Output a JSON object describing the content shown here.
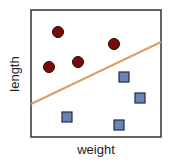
{
  "chart_data": {
    "type": "scatter",
    "title": "",
    "xlabel": "weight",
    "ylabel": "length",
    "grid": false,
    "legend": null,
    "axis_ticks": false,
    "plot_box": {
      "left": 31,
      "top": 10,
      "right": 161,
      "bottom": 137
    },
    "series": [
      {
        "name": "class-circle",
        "marker": "circle",
        "color": "#7a0a0a",
        "points": [
          {
            "x": 58,
            "y": 32
          },
          {
            "x": 114,
            "y": 44
          },
          {
            "x": 49,
            "y": 67
          },
          {
            "x": 78,
            "y": 62
          }
        ]
      },
      {
        "name": "class-square",
        "marker": "square",
        "color": "#6b84b8",
        "points": [
          {
            "x": 124,
            "y": 77
          },
          {
            "x": 140,
            "y": 98
          },
          {
            "x": 67,
            "y": 117
          },
          {
            "x": 119,
            "y": 125
          }
        ]
      }
    ],
    "decision_boundary": {
      "color": "#d9a063",
      "x1": 31,
      "y1": 104,
      "x2": 161,
      "y2": 42
    }
  },
  "labels": {
    "x_axis": "weight",
    "y_axis": "length"
  },
  "colors": {
    "frame": "#333333",
    "circle_fill": "#7a0a0a",
    "circle_stroke": "#2a0505",
    "square_fill": "#6b84b8",
    "square_stroke": "#1f2a44",
    "line": "#d9a063"
  }
}
